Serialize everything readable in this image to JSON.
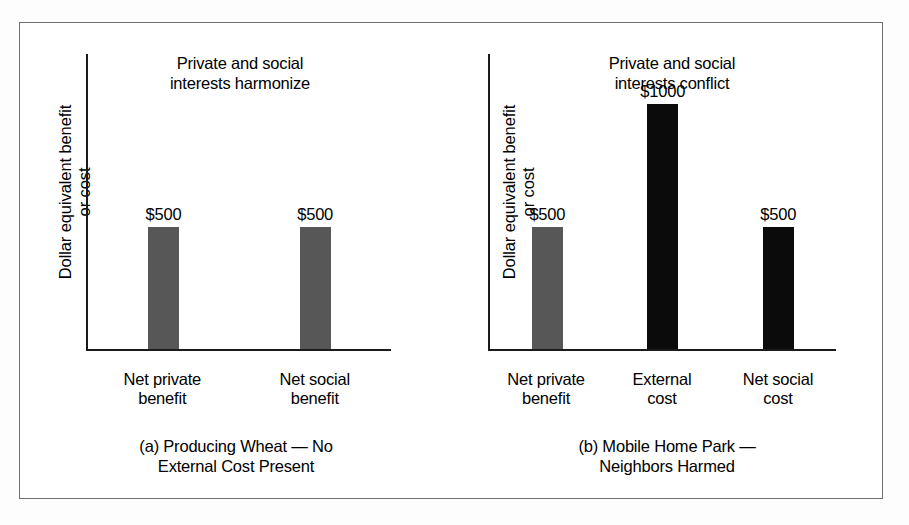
{
  "figure": {
    "frame_color": "#6f6f6f",
    "background_color": "#ffffff"
  },
  "axis_label": "Dollar equivalent benefit\nor cost",
  "panels": [
    {
      "id": "a",
      "title": "Private and social\ninterests harmonize",
      "caption": "(a) Producing Wheat — No\nExternal Cost Present",
      "categories": [
        "Net private\nbenefit",
        "Net social\nbenefit"
      ],
      "bars": [
        {
          "value_label": "$500",
          "value": 500,
          "color": "#575757",
          "style": "gray"
        },
        {
          "value_label": "$500",
          "value": 500,
          "color": "#575757",
          "style": "gray"
        }
      ]
    },
    {
      "id": "b",
      "title": "Private and social\ninterests conflict",
      "caption": "(b) Mobile Home Park —\nNeighbors Harmed",
      "categories": [
        "Net private\nbenefit",
        "External\ncost",
        "Net social\ncost"
      ],
      "bars": [
        {
          "value_label": "$500",
          "value": 500,
          "color": "#575757",
          "style": "gray"
        },
        {
          "value_label": "$1000",
          "value": 1000,
          "color": "#0b0b0b",
          "style": "black"
        },
        {
          "value_label": "$500",
          "value": 500,
          "color": "#0b0b0b",
          "style": "black"
        }
      ]
    }
  ],
  "chart_data": {
    "type": "bar",
    "title": "",
    "panels": [
      {
        "panel": "a",
        "title": "Private and social interests harmonize",
        "caption": "(a) Producing Wheat — No External Cost Present",
        "xlabel": "",
        "ylabel": "Dollar equivalent benefit or cost",
        "categories": [
          "Net private benefit",
          "Net social benefit"
        ],
        "values": [
          500,
          500
        ],
        "value_labels": [
          "$500",
          "$500"
        ],
        "bar_colors": [
          "#575757",
          "#575757"
        ],
        "ylim": [
          0,
          1200
        ],
        "grid": false,
        "legend": "none",
        "axis_ticks": []
      },
      {
        "panel": "b",
        "title": "Private and social interests conflict",
        "caption": "(b) Mobile Home Park — Neighbors Harmed",
        "xlabel": "",
        "ylabel": "Dollar equivalent benefit or cost",
        "categories": [
          "Net private benefit",
          "External cost",
          "Net social cost"
        ],
        "values": [
          500,
          1000,
          500
        ],
        "value_labels": [
          "$500",
          "$1000",
          "$500"
        ],
        "bar_colors": [
          "#575757",
          "#0b0b0b",
          "#0b0b0b"
        ],
        "ylim": [
          0,
          1200
        ],
        "grid": false,
        "legend": "none",
        "axis_ticks": []
      }
    ]
  }
}
